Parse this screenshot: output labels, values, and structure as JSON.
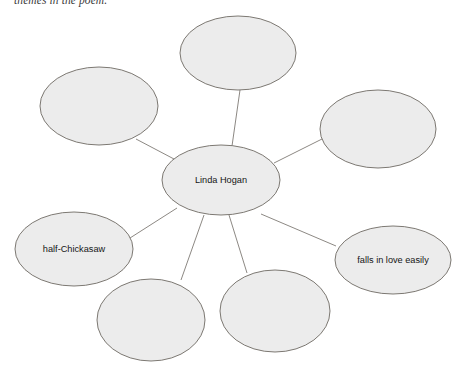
{
  "document": {
    "header_text": "themes in the poem.",
    "type": "concept-map",
    "note": "spider / web organizer"
  },
  "colors": {
    "node_fill": "#ececec",
    "node_stroke": "#6e6a63",
    "connector": "#6e6a63",
    "label_text": "#151515",
    "header_text": "#3a3a3a",
    "background": "#ffffff"
  },
  "chart_data": {
    "type": "diagram",
    "title": "",
    "center": {
      "id": "center",
      "label": "Linda Hogan",
      "cx": 221,
      "cy": 180,
      "rx": 59,
      "ry": 35
    },
    "nodes": [
      {
        "id": "node-top",
        "label": "",
        "cx": 238,
        "cy": 53,
        "rx": 58,
        "ry": 37
      },
      {
        "id": "node-upper-left",
        "label": "",
        "cx": 99,
        "cy": 106,
        "rx": 59,
        "ry": 39
      },
      {
        "id": "node-upper-right",
        "label": "",
        "cx": 378,
        "cy": 129,
        "rx": 58,
        "ry": 39
      },
      {
        "id": "node-left",
        "label": "half-Chickasaw",
        "cx": 74,
        "cy": 249,
        "rx": 59,
        "ry": 37
      },
      {
        "id": "node-right",
        "label": "falls in love easily",
        "cx": 393,
        "cy": 260,
        "rx": 58,
        "ry": 34
      },
      {
        "id": "node-bottom-left",
        "label": "",
        "cx": 151,
        "cy": 320,
        "rx": 54,
        "ry": 41
      },
      {
        "id": "node-bottom-right",
        "label": "",
        "cx": 275,
        "cy": 311,
        "rx": 55,
        "ry": 41
      }
    ],
    "edges": [
      {
        "from": "center",
        "to": "node-top",
        "x1": 232,
        "y1": 146,
        "x2": 240,
        "y2": 90
      },
      {
        "from": "center",
        "to": "node-upper-left",
        "x1": 174,
        "y1": 159,
        "x2": 136,
        "y2": 139
      },
      {
        "from": "center",
        "to": "node-upper-right",
        "x1": 274,
        "y1": 163,
        "x2": 322,
        "y2": 139
      },
      {
        "from": "center",
        "to": "node-left",
        "x1": 177,
        "y1": 208,
        "x2": 130,
        "y2": 238
      },
      {
        "from": "center",
        "to": "node-right",
        "x1": 261,
        "y1": 214,
        "x2": 336,
        "y2": 246
      },
      {
        "from": "center",
        "to": "node-bottom-left",
        "x1": 204,
        "y1": 215,
        "x2": 181,
        "y2": 280
      },
      {
        "from": "center",
        "to": "node-bottom-right",
        "x1": 229,
        "y1": 215,
        "x2": 247,
        "y2": 273
      }
    ]
  }
}
